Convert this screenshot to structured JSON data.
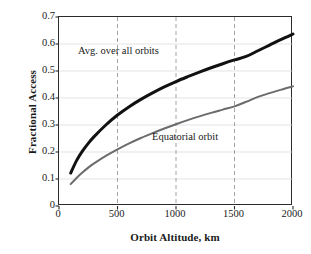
{
  "chart_data": {
    "type": "line",
    "title": "",
    "xlabel": "Orbit Altitude, km",
    "ylabel": "Fractional Access",
    "xlim": [
      0,
      2000
    ],
    "ylim": [
      0,
      0.7
    ],
    "xticks": [
      "0",
      "500",
      "1000",
      "1500",
      "2000"
    ],
    "xtick_values": [
      0,
      500,
      1000,
      1500,
      2000
    ],
    "yticks": [
      "0",
      "0.1",
      "0.2",
      "0.3",
      "0.4",
      "0.5",
      "0.6",
      "0.7"
    ],
    "ytick_values": [
      0,
      0.1,
      0.2,
      0.3,
      0.4,
      0.5,
      0.6,
      0.7
    ],
    "grid": "dashed vertical gridlines at 500, 1000, 1500; faint horizontal gridlines at each 0.1",
    "legend_position": "inline annotations next to curves",
    "series": [
      {
        "name": "Avg. over all orbits",
        "color": "#111111",
        "label_text": "Avg. over all orbits",
        "x": [
          100,
          150,
          200,
          250,
          300,
          400,
          500,
          600,
          700,
          800,
          900,
          1000,
          1100,
          1200,
          1300,
          1400,
          1500,
          1600,
          1700,
          1800,
          1900,
          2000
        ],
        "values": [
          0.122,
          0.168,
          0.203,
          0.232,
          0.257,
          0.3,
          0.337,
          0.368,
          0.395,
          0.419,
          0.441,
          0.461,
          0.479,
          0.496,
          0.512,
          0.527,
          0.541,
          0.554,
          0.575,
          0.596,
          0.617,
          0.637
        ]
      },
      {
        "name": "Equatorial orbit",
        "color": "#6b6b6b",
        "label_text": "Equatorial orbit",
        "x": [
          100,
          150,
          200,
          250,
          300,
          400,
          500,
          600,
          700,
          800,
          900,
          1000,
          1100,
          1200,
          1300,
          1400,
          1500,
          1600,
          1700,
          1800,
          1900,
          2000
        ],
        "values": [
          0.081,
          0.104,
          0.124,
          0.142,
          0.158,
          0.186,
          0.21,
          0.232,
          0.252,
          0.27,
          0.287,
          0.303,
          0.318,
          0.332,
          0.345,
          0.357,
          0.369,
          0.386,
          0.404,
          0.418,
          0.431,
          0.443
        ]
      }
    ]
  }
}
